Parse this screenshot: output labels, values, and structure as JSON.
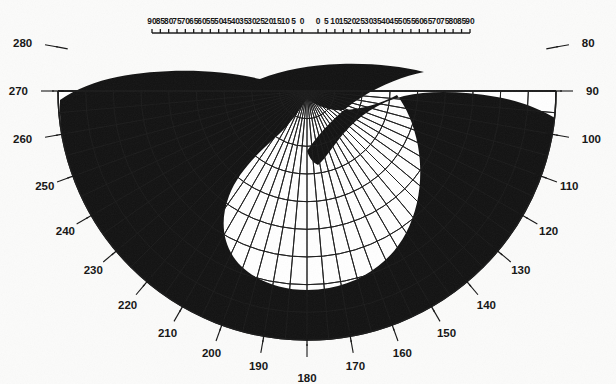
{
  "chart": {
    "type": "polar",
    "title": "",
    "center": {
      "x": 307,
      "y": 91
    },
    "outer_radius": 249,
    "angle_range_deg": [
      0,
      180
    ],
    "orientation": "semicircle below horizontal meridian, radial meridians every 5 degrees"
  },
  "chart_data": {
    "type": "polar",
    "title": "",
    "xlabel": "",
    "ylabel": "",
    "grid": true,
    "legend": null,
    "eccentricity_rings_deg": [
      10,
      20,
      30,
      40,
      50,
      60,
      70,
      80,
      90
    ],
    "meridian_step_deg": 5,
    "top_scale_left": [
      "90",
      "85",
      "80",
      "75",
      "70",
      "65",
      "60",
      "55",
      "50",
      "45",
      "40",
      "35",
      "30",
      "25",
      "20",
      "15",
      "10",
      "5",
      "0"
    ],
    "top_scale_right": [
      "0",
      "5",
      "10",
      "15",
      "20",
      "25",
      "30",
      "35",
      "40",
      "45",
      "50",
      "55",
      "60",
      "65",
      "70",
      "75",
      "80",
      "85",
      "90"
    ],
    "left_meridian_labels": [
      "280",
      "270",
      "260",
      "250",
      "240",
      "230",
      "220",
      "210",
      "200",
      "190",
      "180"
    ],
    "right_meridian_labels": [
      "80",
      "90",
      "100",
      "110",
      "120",
      "130",
      "140",
      "150",
      "160",
      "170",
      "180"
    ],
    "filled_region_name": "scotoma",
    "filled_region_color": "#121212",
    "background_color": "#fbfbfa",
    "grid_color": "#1b1b1b",
    "seen_area_color": "#ffffff"
  },
  "labels": {
    "top_left": [
      {
        "text": "90",
        "deg": 90
      },
      {
        "text": "85",
        "deg": 85
      },
      {
        "text": "80",
        "deg": 80
      },
      {
        "text": "75",
        "deg": 75
      },
      {
        "text": "70",
        "deg": 70
      },
      {
        "text": "65",
        "deg": 65
      },
      {
        "text": "60",
        "deg": 60
      },
      {
        "text": "55",
        "deg": 55
      },
      {
        "text": "50",
        "deg": 50
      },
      {
        "text": "45",
        "deg": 45
      },
      {
        "text": "40",
        "deg": 40
      },
      {
        "text": "35",
        "deg": 35
      },
      {
        "text": "30",
        "deg": 30
      },
      {
        "text": "25",
        "deg": 25
      },
      {
        "text": "20",
        "deg": 20
      },
      {
        "text": "15",
        "deg": 15
      },
      {
        "text": "10",
        "deg": 10
      },
      {
        "text": "5",
        "deg": 5
      },
      {
        "text": "0",
        "deg": 0
      }
    ],
    "top_right": [
      {
        "text": "0",
        "deg": 0
      },
      {
        "text": "5",
        "deg": 5
      },
      {
        "text": "10",
        "deg": 10
      },
      {
        "text": "15",
        "deg": 15
      },
      {
        "text": "20",
        "deg": 20
      },
      {
        "text": "25",
        "deg": 25
      },
      {
        "text": "30",
        "deg": 30
      },
      {
        "text": "35",
        "deg": 35
      },
      {
        "text": "40",
        "deg": 40
      },
      {
        "text": "45",
        "deg": 45
      },
      {
        "text": "50",
        "deg": 50
      },
      {
        "text": "55",
        "deg": 55
      },
      {
        "text": "60",
        "deg": 60
      },
      {
        "text": "65",
        "deg": 65
      },
      {
        "text": "70",
        "deg": 70
      },
      {
        "text": "75",
        "deg": 75
      },
      {
        "text": "80",
        "deg": 80
      },
      {
        "text": "85",
        "deg": 85
      },
      {
        "text": "90",
        "deg": 90
      }
    ],
    "perimeter": [
      {
        "text": "280",
        "deg": 280
      },
      {
        "text": "270",
        "deg": 270
      },
      {
        "text": "260",
        "deg": 260
      },
      {
        "text": "250",
        "deg": 250
      },
      {
        "text": "240",
        "deg": 240
      },
      {
        "text": "230",
        "deg": 230
      },
      {
        "text": "220",
        "deg": 220
      },
      {
        "text": "210",
        "deg": 210
      },
      {
        "text": "200",
        "deg": 200
      },
      {
        "text": "190",
        "deg": 190
      },
      {
        "text": "180",
        "deg": 180
      },
      {
        "text": "170",
        "deg": 170
      },
      {
        "text": "160",
        "deg": 160
      },
      {
        "text": "150",
        "deg": 150
      },
      {
        "text": "140",
        "deg": 140
      },
      {
        "text": "130",
        "deg": 130
      },
      {
        "text": "120",
        "deg": 120
      },
      {
        "text": "110",
        "deg": 110
      },
      {
        "text": "100",
        "deg": 100
      },
      {
        "text": "90",
        "deg": 90
      },
      {
        "text": "80",
        "deg": 80
      }
    ]
  }
}
